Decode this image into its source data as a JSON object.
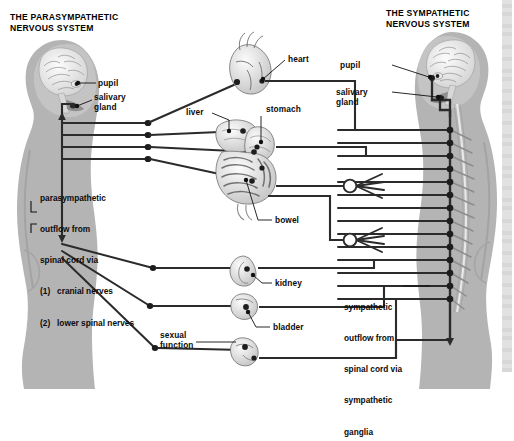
{
  "figure": {
    "kind": "anatomical-diagram",
    "background": "#ffffff",
    "body_fill": "#b4b4b4",
    "nerve_color": "#2b2b2b",
    "leader_color": "#111111"
  },
  "titles": {
    "left": "THE PARASYMPATHETIC\nNERVOUS SYSTEM",
    "right": "THE SYMPATHETIC\nNERVOUS SYSTEM"
  },
  "left_labels": {
    "pupil": "pupil",
    "salivary_gland": "salivary\ngland"
  },
  "right_labels": {
    "pupil": "pupil",
    "salivary_gland": "salivary\ngland"
  },
  "organ_labels": {
    "heart": "heart",
    "liver": "liver",
    "stomach": "stomach",
    "bowel": "bowel",
    "kidney": "kidney",
    "bladder": "bladder",
    "sexual_function": "sexual\nfunction"
  },
  "captions": {
    "parasympathetic": {
      "line1": "parasympathetic",
      "line2": "outflow from",
      "line3": "spinal cord via",
      "item1": "(1)   cranial nerves",
      "item2": "(2)   lower spinal nerves"
    },
    "sympathetic": {
      "line1": "sympathetic",
      "line2": "outflow from",
      "line3": "spinal cord via",
      "line4": "sympathetic",
      "line5": "ganglia"
    }
  },
  "chain": {
    "ganglion_count": 14,
    "collateral_ganglia": 3
  }
}
